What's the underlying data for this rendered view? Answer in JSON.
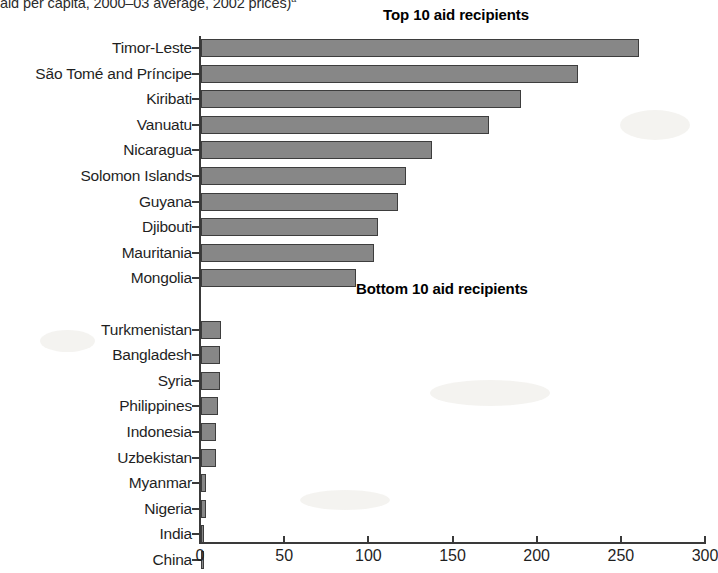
{
  "caption": {
    "text": "aid per capita, 2000–03 average, 2002 prices)",
    "footnote_marker": "a"
  },
  "headings": {
    "top": "Top 10 aid recipients",
    "bottom": "Bottom 10 aid recipients"
  },
  "axis": {
    "x_ticks": [
      "0",
      "50",
      "100",
      "150",
      "200",
      "250",
      "300"
    ]
  },
  "colors": {
    "bar_fill": "#878787",
    "bar_outline": "#3d3d3d",
    "axis": "#3a3a3a",
    "text": "#1f1f1f",
    "background": "#ffffff"
  },
  "chart_data": {
    "type": "bar",
    "orientation": "horizontal",
    "subtitle": "aid per capita, 2000–03 average, 2002 prices)",
    "xlabel": "",
    "ylabel": "",
    "xlim": [
      0,
      300
    ],
    "xticks": [
      0,
      50,
      100,
      150,
      200,
      250,
      300
    ],
    "grid": false,
    "legend": null,
    "groups": [
      {
        "name": "Top 10 aid recipients",
        "categories": [
          "Timor-Leste",
          "São Tomé and Príncipe",
          "Kiribati",
          "Vanuatu",
          "Nicaragua",
          "Solomon Islands",
          "Guyana",
          "Djibouti",
          "Mauritania",
          "Mongolia"
        ],
        "values": [
          260,
          224,
          190,
          171,
          137,
          122,
          117,
          105,
          103,
          92
        ]
      },
      {
        "name": "Bottom 10 aid recipients",
        "categories": [
          "Turkmenistan",
          "Bangladesh",
          "Syria",
          "Philippines",
          "Indonesia",
          "Uzbekistan",
          "Myanmar",
          "Nigeria",
          "India",
          "China"
        ],
        "values": [
          12,
          11,
          11,
          10,
          9,
          9,
          3,
          3,
          2,
          2
        ]
      }
    ]
  }
}
